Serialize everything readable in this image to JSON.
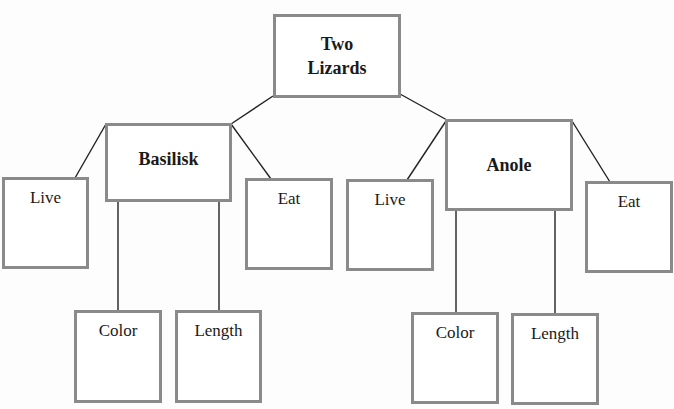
{
  "diagram": {
    "type": "tree",
    "root": {
      "label": "Two Lizards",
      "label_lines": [
        "Two",
        "Lizards"
      ],
      "children": [
        {
          "label": "Basilisk",
          "children": [
            {
              "label": "Live"
            },
            {
              "label": "Color"
            },
            {
              "label": "Length"
            },
            {
              "label": "Eat"
            }
          ]
        },
        {
          "label": "Anole",
          "children": [
            {
              "label": "Live"
            },
            {
              "label": "Color"
            },
            {
              "label": "Length"
            },
            {
              "label": "Eat"
            }
          ]
        }
      ]
    },
    "colors": {
      "box_border": "#8a8a8a",
      "line": "#222222",
      "text": "#1a1a1a"
    }
  }
}
